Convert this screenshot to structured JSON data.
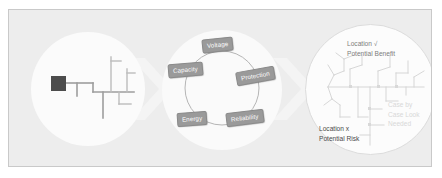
{
  "slide": {
    "background_color": "#ffffff",
    "panel_color": "#ededed",
    "panel_border_color": "#c9c9c9"
  },
  "stages": {
    "left": {
      "name": "distribution-feeder-overview",
      "circle_color": "#fbfbfb",
      "substation_color": "#4c4c4c",
      "line_color": "#9e9e9e"
    },
    "middle": {
      "name": "planning-criteria-cycle",
      "circle_color": "#fafafa",
      "node_fill": "#9a9a9a",
      "node_text_color": "#ffffff",
      "ring_color": "#b5b5b5",
      "nodes": [
        {
          "label": "Voltage"
        },
        {
          "label": "Protection"
        },
        {
          "label": "Reliability"
        },
        {
          "label": "Energy"
        },
        {
          "label": "Capacity"
        }
      ]
    },
    "right": {
      "name": "location-assessment-map",
      "circle_color": "#fcfcfc",
      "circle_border_color": "#dcdcdc",
      "annotations": [
        {
          "id": "benefit",
          "line1": "Location √",
          "line2": "Potential Benefit",
          "color": "#7d7d7d"
        },
        {
          "id": "risk",
          "line1": "Location x",
          "line2": "Potential Risk",
          "color": "#4a4a4a"
        },
        {
          "id": "case-by-case",
          "line1": "Case by",
          "line2": "Case Look",
          "line3": "Needed",
          "color": "#d8d8d8"
        }
      ]
    }
  },
  "chevrons": {
    "color": "#f4f4f4",
    "count": 2
  }
}
